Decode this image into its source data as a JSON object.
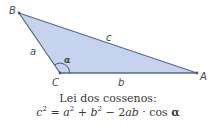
{
  "diagram": {
    "type": "triangle",
    "fill_color": "#c5d3ef",
    "stroke_color": "#5a6a8a",
    "vertices": {
      "A": {
        "label": "A",
        "x": 197,
        "y": 73
      },
      "B": {
        "label": "B",
        "x": 19,
        "y": 13
      },
      "C": {
        "label": "C",
        "x": 60,
        "y": 73
      }
    },
    "sides": {
      "a": "a",
      "b": "b",
      "c": "c"
    },
    "angle": {
      "label": "α",
      "vertex": "C"
    }
  },
  "caption": {
    "title": "Lei dos cossenos:",
    "formula": {
      "c": "c",
      "exp": "2",
      "eq": " = ",
      "a": "a",
      "plus": " + ",
      "b": "b",
      "minus": " − 2",
      "ab": "ab",
      "cos": " · cos ",
      "alpha": "α"
    }
  }
}
